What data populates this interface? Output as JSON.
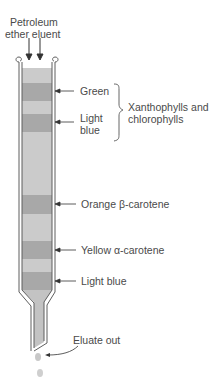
{
  "eluent": {
    "line1": "Petroleum",
    "line2": "ether eluent"
  },
  "bands": [
    {
      "label": "Green",
      "y": 91
    },
    {
      "label_line1": "Light",
      "label_line2": "blue",
      "y": 122
    },
    {
      "label": "Orange β-carotene",
      "y": 204
    },
    {
      "label": "Yellow α-carotene",
      "y": 250
    },
    {
      "label": "Light blue",
      "y": 281
    }
  ],
  "group": {
    "line1": "Xanthophylls and",
    "line2": "chlorophylls"
  },
  "eluate": {
    "label": "Eluate out"
  },
  "colors": {
    "band": "#a9a9a9",
    "packing": "#c8c8c8",
    "wall": "#6a6a6a",
    "text": "#4a4a4a"
  }
}
